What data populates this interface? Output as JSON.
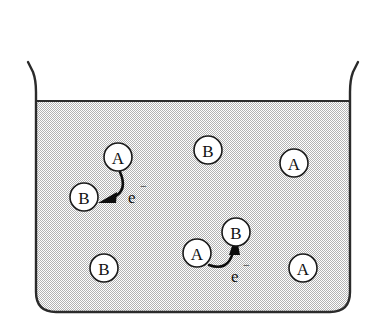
{
  "figure": {
    "type": "scientific-diagram",
    "background_color": "#ffffff"
  },
  "beaker": {
    "name": "beaker",
    "outline_color": "#2b2b2b",
    "liquid_fill_color": "#d9d9d9",
    "liquid_pattern": "stipple-dither",
    "liquid_surface_label": "",
    "left_wall_x": 36,
    "right_wall_x": 350,
    "liquid_surface_y": 101,
    "bottom_y": 312,
    "rim_top_y": 62
  },
  "species": {
    "a_label": "A",
    "b_label": "B",
    "electron_label": "e",
    "electron_charge": "−"
  },
  "particles": [
    {
      "id": "a-donor-1",
      "label": "A",
      "cx": 118,
      "cy": 157,
      "r": 14
    },
    {
      "id": "b-acceptor-1",
      "label": "B",
      "cx": 84,
      "cy": 197,
      "r": 14
    },
    {
      "id": "b-free-1",
      "label": "B",
      "cx": 208,
      "cy": 150,
      "r": 14
    },
    {
      "id": "a-free-1",
      "label": "A",
      "cx": 294,
      "cy": 163,
      "r": 14
    },
    {
      "id": "b-acceptor-2",
      "label": "B",
      "cx": 236,
      "cy": 232,
      "r": 14
    },
    {
      "id": "a-donor-2",
      "label": "A",
      "cx": 197,
      "cy": 253,
      "r": 14
    },
    {
      "id": "b-free-2",
      "label": "B",
      "cx": 104,
      "cy": 268,
      "r": 14
    },
    {
      "id": "a-free-2",
      "label": "A",
      "cx": 303,
      "cy": 268,
      "r": 14
    }
  ],
  "transfers": [
    {
      "id": "transfer-1",
      "from": "a-donor-1",
      "to": "b-acceptor-1",
      "label": "e",
      "charge": "−",
      "label_x": 128,
      "label_y": 196,
      "direction": "down-left"
    },
    {
      "id": "transfer-2",
      "from": "a-donor-2",
      "to": "b-acceptor-2",
      "label": "e",
      "charge": "−",
      "label_x": 231,
      "label_y": 275,
      "direction": "up-right"
    }
  ]
}
